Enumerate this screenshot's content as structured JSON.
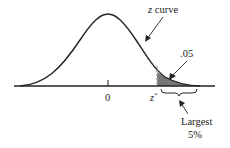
{
  "diagram": {
    "type": "normal-curve-upper-tail",
    "curve_label_var": "z",
    "curve_label_rest": " curve",
    "tail_area_label": ".05",
    "center_tick_label": "0",
    "critical_value_var": "z",
    "critical_value_sup": "*",
    "region_label_line1": "Largest",
    "region_label_line2": "5%",
    "colors": {
      "line": "#222222",
      "shade": "#777777",
      "background": "#ffffff"
    }
  }
}
